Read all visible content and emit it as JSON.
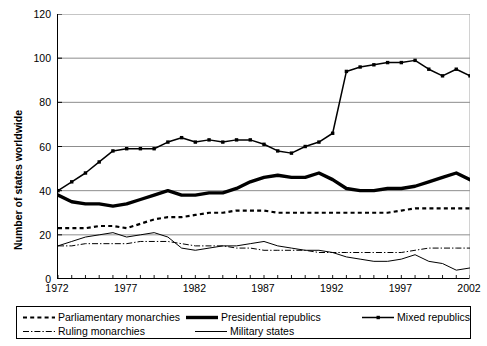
{
  "chart_data": {
    "type": "line",
    "title": "",
    "xlabel": "",
    "ylabel": "Number of states worldwide",
    "xlim": [
      1972,
      2002
    ],
    "ylim": [
      0,
      120
    ],
    "ytick_values": [
      0,
      20,
      40,
      60,
      80,
      100,
      120
    ],
    "xtick_labels": [
      "1972",
      "1977",
      "1982",
      "1987",
      "1992",
      "1997",
      "2002"
    ],
    "xtick_values": [
      1972,
      1977,
      1982,
      1987,
      1992,
      1997,
      2002
    ],
    "grid": "horizontal",
    "legend_position": "below-plot",
    "x": [
      1972,
      1973,
      1974,
      1975,
      1976,
      1977,
      1978,
      1979,
      1980,
      1981,
      1982,
      1983,
      1984,
      1985,
      1986,
      1987,
      1988,
      1989,
      1990,
      1991,
      1992,
      1993,
      1994,
      1995,
      1996,
      1997,
      1998,
      1999,
      2000,
      2001,
      2002
    ],
    "series": [
      {
        "name": "Parliamentary monarchies",
        "style": "dashed",
        "color": "#000000",
        "values": [
          23,
          23,
          23,
          24,
          24,
          23,
          25,
          27,
          28,
          28,
          29,
          30,
          30,
          31,
          31,
          31,
          30,
          30,
          30,
          30,
          30,
          30,
          30,
          30,
          30,
          31,
          32,
          32,
          32,
          32,
          32
        ]
      },
      {
        "name": "Presidential republics",
        "style": "thick-solid",
        "color": "#000000",
        "values": [
          38,
          35,
          34,
          34,
          33,
          34,
          36,
          38,
          40,
          38,
          38,
          39,
          39,
          41,
          44,
          46,
          47,
          46,
          46,
          48,
          45,
          41,
          40,
          40,
          41,
          41,
          42,
          44,
          46,
          48,
          45
        ]
      },
      {
        "name": "Mixed republics",
        "style": "solid-markers",
        "color": "#000000",
        "values": [
          40,
          44,
          48,
          53,
          58,
          59,
          59,
          59,
          62,
          64,
          62,
          63,
          62,
          63,
          63,
          61,
          58,
          57,
          60,
          62,
          66,
          94,
          96,
          97,
          98,
          98,
          99,
          95,
          92,
          95,
          92
        ]
      },
      {
        "name": "Ruling monarchies",
        "style": "dash-dot",
        "color": "#000000",
        "values": [
          15,
          15,
          16,
          16,
          16,
          16,
          17,
          17,
          17,
          16,
          15,
          15,
          15,
          14,
          14,
          13,
          13,
          13,
          13,
          12,
          12,
          12,
          12,
          12,
          12,
          12,
          13,
          14,
          14,
          14,
          14
        ]
      },
      {
        "name": "Military states",
        "style": "thin-solid",
        "color": "#000000",
        "values": [
          15,
          17,
          19,
          20,
          21,
          19,
          20,
          21,
          19,
          14,
          13,
          14,
          15,
          15,
          16,
          17,
          15,
          14,
          13,
          13,
          12,
          10,
          9,
          8,
          8,
          9,
          11,
          8,
          7,
          4,
          5
        ]
      }
    ]
  },
  "legend": {
    "row1": [
      {
        "label": "Parliamentary monarchies",
        "style": "dashed"
      },
      {
        "label": "Presidential republics",
        "style": "thick-solid"
      },
      {
        "label": "Mixed republics",
        "style": "solid-markers"
      }
    ],
    "row2": [
      {
        "label": "Ruling monarchies",
        "style": "dash-dot"
      },
      {
        "label": "Military states",
        "style": "thin-solid"
      }
    ]
  }
}
